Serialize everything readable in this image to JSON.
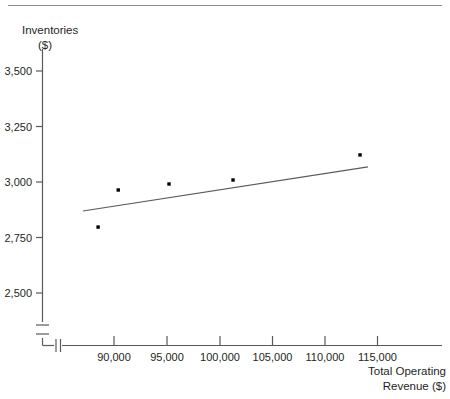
{
  "figure": {
    "title_rule": true,
    "y_axis_title_line1": "Inventories",
    "y_axis_title_line2": "($)",
    "x_axis_title_line1": "Total Operating",
    "x_axis_title_line2": "Revenue ($)"
  },
  "chart_data": {
    "type": "scatter",
    "title": "",
    "xlabel": "Total Operating Revenue ($)",
    "ylabel": "Inventories ($)",
    "xlim": [
      86000,
      117500
    ],
    "ylim": [
      2375,
      3625
    ],
    "grid": false,
    "legend": "none",
    "axis_break_x": true,
    "axis_break_y": true,
    "xticks": [
      90000,
      95000,
      100000,
      105000,
      110000,
      115000
    ],
    "xticklabels": [
      "90,000",
      "95,000",
      "100,000",
      "105,000",
      "110,000",
      "115,000"
    ],
    "yticks": [
      2500,
      2750,
      3000,
      3250,
      3500
    ],
    "yticklabels": [
      "2,500",
      "2,750",
      "3,000",
      "3,250",
      "3,500"
    ],
    "series": [
      {
        "name": "Inventories vs Total Operating Revenue",
        "marker": "square",
        "color": "#000000",
        "points": [
          {
            "x": 88500,
            "y": 2797
          },
          {
            "x": 90400,
            "y": 2964
          },
          {
            "x": 95190,
            "y": 2991
          },
          {
            "x": 101230,
            "y": 3009
          },
          {
            "x": 113210,
            "y": 3122
          }
        ]
      }
    ],
    "trendline": {
      "name": "linear fit",
      "color": "#58595b",
      "x_start": 87070,
      "y_start": 2869,
      "x_end": 113960,
      "y_end": 3068
    }
  }
}
